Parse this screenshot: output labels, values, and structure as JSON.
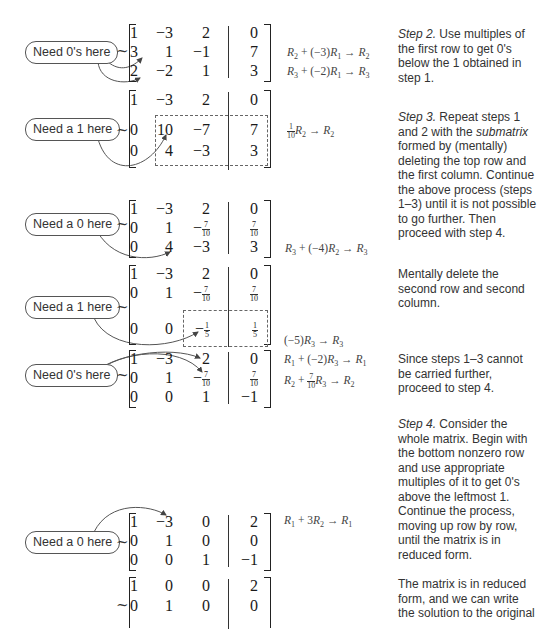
{
  "callouts": [
    {
      "text": "Need 0's here"
    },
    {
      "text": "Need a 1 here"
    },
    {
      "text": "Need a 0 here"
    },
    {
      "text": "Need a 1 here"
    },
    {
      "text": "Need 0's here"
    },
    {
      "text": "Need a 0 here"
    }
  ],
  "tilde": "~",
  "matrices": [
    {
      "rows": [
        [
          "1",
          "-3",
          "2",
          "0"
        ],
        [
          "3",
          "1",
          "-1",
          "7"
        ],
        [
          "2",
          "-2",
          "1",
          "3"
        ]
      ],
      "ops": [
        "R2 + (-3)R1 → R2",
        "R3 + (-2)R1 → R3"
      ]
    },
    {
      "rows": [
        [
          "1",
          "-3",
          "2",
          "0"
        ],
        [
          "0",
          "10",
          "-7",
          "7"
        ],
        [
          "0",
          "4",
          "-3",
          "3"
        ]
      ],
      "ops": [
        "(1/10)R2 → R2"
      ]
    },
    {
      "rows": [
        [
          "1",
          "-3",
          "2",
          "0"
        ],
        [
          "0",
          "1",
          "-7/10",
          "7/10"
        ],
        [
          "0",
          "4",
          "-3",
          "3"
        ]
      ],
      "ops": [
        "R3 + (-4)R2 → R3"
      ]
    },
    {
      "rows": [
        [
          "1",
          "-3",
          "2",
          "0"
        ],
        [
          "0",
          "1",
          "-7/10",
          "7/10"
        ],
        [
          "0",
          "0",
          "-1/5",
          "1/5"
        ]
      ],
      "ops": [
        "(-5)R3 → R3"
      ]
    },
    {
      "rows": [
        [
          "1",
          "-3",
          "2",
          "0"
        ],
        [
          "0",
          "1",
          "-7/10",
          "7/10"
        ],
        [
          "0",
          "0",
          "1",
          "-1"
        ]
      ],
      "ops": [
        "R1 + (-2)R3 → R1",
        "R2 + (7/10)R3 → R2"
      ]
    },
    {
      "rows": [
        [
          "1",
          "-3",
          "0",
          "2"
        ],
        [
          "0",
          "1",
          "0",
          "0"
        ],
        [
          "0",
          "0",
          "1",
          "-1"
        ]
      ],
      "ops": [
        "R1 + 3R2 → R1"
      ]
    },
    {
      "rows": [
        [
          "1",
          "0",
          "0",
          "2"
        ],
        [
          "0",
          "1",
          "0",
          "0"
        ]
      ],
      "ops": []
    }
  ],
  "notes": {
    "step2_label": "Step 2.",
    "step2_text": " Use multiples of the first row to get 0's below the 1 obtained in step 1.",
    "step3_label": "Step 3.",
    "step3_text_a": " Repeat steps 1 and 2 with the ",
    "step3_em": "submatrix",
    "step3_text_b": " formed by (mentally) deleting the top row and the first column. Continue the above process (steps 1–3) until it is not possible to go further. Then proceed with step 4.",
    "mentally_delete": "Mentally delete the second row and second column.",
    "since_steps": "Since steps 1–3 cannot be carried further, proceed to step 4.",
    "step4_label": "Step 4.",
    "step4_text": " Consider the whole matrix. Begin with the bottom nonzero row and use appropriate multiples of it to get 0's above the leftmost 1. Continue the process, moving up row by row, until the matrix is in reduced form.",
    "reduced_form": "The matrix is in reduced form, and we can write the solution to the original"
  }
}
